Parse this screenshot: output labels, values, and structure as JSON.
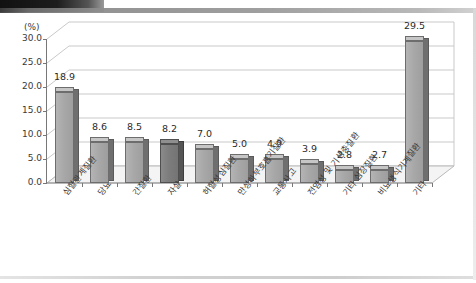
{
  "chart_data": {
    "type": "bar",
    "title": "",
    "xlabel": "",
    "ylabel": "",
    "unit_label": "(%)",
    "ylim": [
      0,
      30
    ],
    "ytick_step": 5,
    "ytick_labels": [
      "0.0",
      "5.0",
      "10.0",
      "15.0",
      "20.0",
      "25.0",
      "30.0"
    ],
    "grid": true,
    "legend": "none",
    "style": "3d-column",
    "categories": [
      "심혈관계질환",
      "당뇨",
      "간질환",
      "자살",
      "허혈성심질환",
      "만성하부호흡기질환",
      "교통사고",
      "전염성 및 기생충질환",
      "기타 심장질환",
      "비뇨생식기계질환",
      "기타"
    ],
    "values": [
      18.9,
      8.6,
      8.5,
      8.2,
      7.0,
      5.0,
      4.9,
      3.9,
      2.8,
      2.7,
      29.5
    ],
    "value_labels": [
      "18.9",
      "8.6",
      "8.5",
      "8.2",
      "7.0",
      "5.0",
      "4.9",
      "3.9",
      "2.8",
      "2.7",
      "29.5"
    ],
    "highlighted_index": 3,
    "colors": {
      "bar_face": "#a8a8a8",
      "bar_side": "#6f6f6f",
      "bar_top": "#c6c6c6",
      "bar_highlight_face": "#7d7d7d",
      "grid": "#c9c9c9",
      "axis": "#777777",
      "text": "#3a3a3a",
      "background": "#ffffff"
    }
  }
}
